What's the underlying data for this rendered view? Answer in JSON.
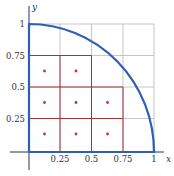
{
  "figure": {
    "axis_labels": {
      "x": "x",
      "y": "y"
    },
    "x_ticks": [
      "0.25",
      "0.5",
      "0.75",
      "1"
    ],
    "y_ticks": [
      "0.25",
      "0.5",
      "0.75",
      "1"
    ],
    "colors": {
      "curve": "#2f5fb5",
      "axes": "#2a2f6e",
      "grid": "#b8b8b8",
      "partition": "#a5323a",
      "points": "#c0303a"
    },
    "curve_label": "quarter circle x^2 + y^2 = 1",
    "sample_points_count": 8
  }
}
